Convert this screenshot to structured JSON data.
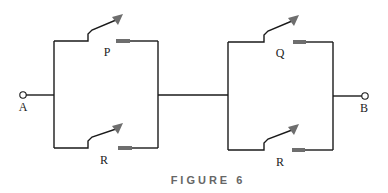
{
  "diagram": {
    "type": "switching-circuit",
    "caption": "FIGURE 6",
    "terminals": [
      {
        "id": "A",
        "label": "A"
      },
      {
        "id": "B",
        "label": "B"
      }
    ],
    "blocks": [
      {
        "name": "left-parallel-block",
        "switches": [
          {
            "label": "P",
            "position": "top"
          },
          {
            "label": "R",
            "position": "bottom"
          }
        ]
      },
      {
        "name": "right-parallel-block",
        "switches": [
          {
            "label": "Q",
            "position": "top"
          },
          {
            "label": "R",
            "position": "bottom"
          }
        ]
      }
    ],
    "colors": {
      "wire": "#1a1a1a",
      "contact": "#6e6e6e",
      "caption": "#666666"
    }
  }
}
